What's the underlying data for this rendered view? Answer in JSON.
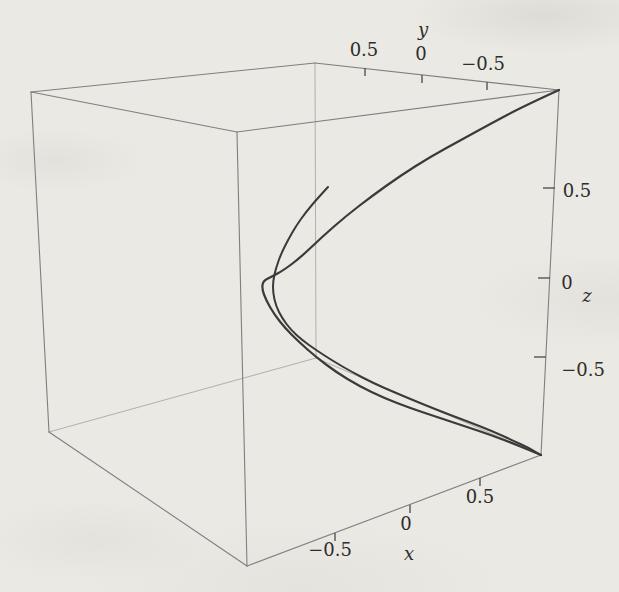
{
  "page": {
    "background": "#eae9e4",
    "figure_alt": "3D perspective box plot of a space curve with axes x, y and z"
  },
  "chart_data": {
    "type": "line",
    "subtype": "3d-parametric-space-curve",
    "title": "",
    "legend": null,
    "grid": false,
    "axes": {
      "x": {
        "label": "x",
        "range": [
          -1,
          1
        ],
        "position": "front-bottom edge",
        "label_px": [
          409,
          555
        ],
        "ticks": [
          {
            "v": "−0.5",
            "at": [
              335,
              533
            ],
            "dir": [
              0,
              1
            ],
            "len": 8,
            "label_px": [
              330,
              551
            ]
          },
          {
            "v": "0",
            "at": [
              410,
              505
            ],
            "dir": [
              0,
              1
            ],
            "len": 8,
            "label_px": [
              406,
              525
            ]
          },
          {
            "v": "0.5",
            "at": [
              480,
              478
            ],
            "dir": [
              0,
              1
            ],
            "len": 8,
            "label_px": [
              480,
              498
            ]
          }
        ]
      },
      "y": {
        "label": "y",
        "range": [
          -1,
          1
        ],
        "position": "back-top edge, values decreasing to the right",
        "label_px": [
          423,
          31
        ],
        "ticks": [
          {
            "v": "0.5",
            "at": [
              365,
              68
            ],
            "dir": [
              0,
              1
            ],
            "len": 8,
            "label_px": [
              364,
              51
            ]
          },
          {
            "v": "0",
            "at": [
              422,
              75
            ],
            "dir": [
              0,
              1
            ],
            "len": 8,
            "label_px": [
              421,
              55
            ]
          },
          {
            "v": "−0.5",
            "at": [
              487,
              82
            ],
            "dir": [
              0,
              1
            ],
            "len": 8,
            "label_px": [
              483,
              65
            ]
          }
        ]
      },
      "z": {
        "label": "z",
        "range": [
          -1,
          1
        ],
        "position": "front-right vertical edge",
        "label_px": [
          587,
          297
        ],
        "ticks": [
          {
            "v": "0.5",
            "at": [
              555,
              188
            ],
            "dir": [
              -1,
              0
            ],
            "len": 12,
            "label_px": [
              577,
              192
            ]
          },
          {
            "v": "0",
            "at": [
              550,
              278
            ],
            "dir": [
              -1,
              0
            ],
            "len": 12,
            "label_px": [
              567,
              284
            ]
          },
          {
            "v": "−0.5",
            "at": [
              546,
              357
            ],
            "dir": [
              -1,
              0
            ],
            "len": 12,
            "label_px": [
              583,
              371
            ]
          }
        ]
      }
    },
    "box": {
      "corners_px": {
        "Lt": [
          31,
          92
        ],
        "Bt": [
          315,
          63
        ],
        "Rt": [
          559,
          90
        ],
        "Ft": [
          237,
          132
        ],
        "Lb": [
          49,
          432
        ],
        "Bb": [
          316,
          358
        ],
        "Rb": [
          541,
          455
        ],
        "Fb": [
          247,
          566
        ]
      },
      "visible_edges": [
        [
          "Lt",
          "Bt"
        ],
        [
          "Bt",
          "Rt"
        ],
        [
          "Lt",
          "Ft"
        ],
        [
          "Ft",
          "Rt"
        ],
        [
          "Lt",
          "Lb"
        ],
        [
          "Ft",
          "Fb"
        ],
        [
          "Rt",
          "Rb"
        ],
        [
          "Lb",
          "Fb"
        ],
        [
          "Fb",
          "Rb"
        ]
      ],
      "hidden_edges": [
        [
          "Bt",
          "Bb"
        ],
        [
          "Bb",
          "Lb"
        ],
        [
          "Bb",
          "Rb"
        ]
      ]
    },
    "curve": {
      "color": "#3a3a3a",
      "description": "space curve drawn as two near-parallel strands; one strand starts at the top-right box corner, both meet at the bottom-right box corner, the second strand ends free in mid-plot",
      "strands": [
        {
          "name": "outer-strand",
          "width": 2.2,
          "points_px": [
            [
              559,
              90
            ],
            [
              524,
              106
            ],
            [
              492,
              123
            ],
            [
              461,
              140
            ],
            [
              430,
              157
            ],
            [
              400,
              176
            ],
            [
              372,
              196
            ],
            [
              346,
              216
            ],
            [
              322,
              237
            ],
            [
              301,
              257
            ],
            [
              284,
              270
            ],
            [
              271,
              277
            ],
            [
              263,
              281
            ],
            [
              262,
              289
            ],
            [
              266,
              300
            ],
            [
              274,
              314
            ],
            [
              285,
              328
            ],
            [
              299,
              342
            ],
            [
              316,
              357
            ],
            [
              336,
              372
            ],
            [
              359,
              386
            ],
            [
              384,
              398
            ],
            [
              410,
              408
            ],
            [
              437,
              417
            ],
            [
              464,
              426
            ],
            [
              491,
              435
            ],
            [
              517,
              445
            ],
            [
              541,
              455
            ]
          ]
        },
        {
          "name": "inner-strand",
          "width": 2.0,
          "points_px": [
            [
              328,
              187
            ],
            [
              317,
              199
            ],
            [
              306,
              212
            ],
            [
              296,
              226
            ],
            [
              288,
              240
            ],
            [
              281,
              254
            ],
            [
              276,
              268
            ],
            [
              273,
              281
            ],
            [
              273,
              293
            ],
            [
              276,
              306
            ],
            [
              282,
              318
            ],
            [
              291,
              330
            ],
            [
              302,
              340
            ],
            [
              316,
              350
            ],
            [
              333,
              361
            ],
            [
              352,
              372
            ],
            [
              373,
              383
            ],
            [
              396,
              393
            ],
            [
              420,
              403
            ],
            [
              445,
              413
            ],
            [
              469,
              422
            ],
            [
              492,
              431
            ],
            [
              514,
              441
            ],
            [
              529,
              448
            ],
            [
              541,
              455
            ]
          ]
        }
      ]
    },
    "styles": {
      "edge_color": "#7f7f7f",
      "hidden_edge_color": "#a8a8a6",
      "tick_color": "#4a4a4a",
      "label_color": "#2e2d2b",
      "tick_font_size": 18,
      "axis_font_size": 18
    }
  }
}
